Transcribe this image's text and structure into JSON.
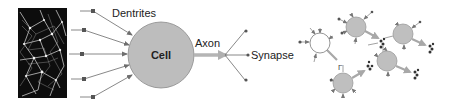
{
  "figure": {
    "panels": [
      "microscope-image",
      "neuron-model",
      "neural-network"
    ]
  },
  "labels": {
    "dentrites": "Dentrites",
    "cell": "Cell",
    "axon": "Axon",
    "synapse": "Synapse",
    "network_marker": "Γ"
  },
  "colors": {
    "cell_fill": "#bdbdbd",
    "cell_stroke": "#8a8a8a",
    "axon_arrow": "#b5b5b5",
    "line": "#7a7a7a",
    "dot": "#555555",
    "input_node_fill": "#ffffff",
    "hidden_node_fill": "#bfbfbf",
    "synapse_cluster": "#333333",
    "background": "#ffffff",
    "micro_bg": "#0d0d0d"
  },
  "neuron_model": {
    "dendrite_inputs": [
      {
        "x": 93,
        "y": 11
      },
      {
        "x": 84,
        "y": 30
      },
      {
        "x": 82,
        "y": 54
      },
      {
        "x": 84,
        "y": 79
      },
      {
        "x": 93,
        "y": 97
      }
    ],
    "cell": {
      "cx": 161,
      "cy": 55,
      "r": 33
    },
    "synapse_outputs": [
      {
        "x": 245,
        "y": 31
      },
      {
        "x": 248,
        "y": 55
      },
      {
        "x": 245,
        "y": 80
      }
    ]
  },
  "network": {
    "nodes": [
      {
        "id": "input",
        "cx": 320,
        "cy": 43,
        "type": "input"
      },
      {
        "id": "a",
        "cx": 356,
        "cy": 27,
        "type": "hidden"
      },
      {
        "id": "b",
        "cx": 403,
        "cy": 34,
        "type": "hidden"
      },
      {
        "id": "c",
        "cx": 387,
        "cy": 61,
        "type": "hidden"
      },
      {
        "id": "d",
        "cx": 343,
        "cy": 83,
        "type": "hidden"
      }
    ]
  }
}
